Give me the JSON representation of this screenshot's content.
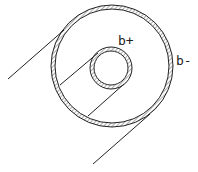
{
  "diagram": {
    "type": "coaxial-cylinder-cross-section",
    "labels": {
      "inner": "b+",
      "outer": "b-"
    },
    "outer_circle": {
      "cx": 112,
      "cy": 66,
      "r": 59
    },
    "inner_circle": {
      "cx": 111,
      "cy": 68,
      "r": 19
    },
    "stroke_color": "#222222",
    "hatch_color": "#888888"
  }
}
